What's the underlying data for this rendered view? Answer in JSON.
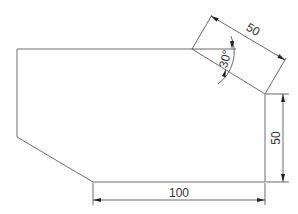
{
  "drawing": {
    "type": "technical-drawing",
    "shape": "chamfered-polygon",
    "dimensions": {
      "bottom_width": "100",
      "right_height": "50",
      "chamfer_length": "50",
      "chamfer_angle": "30°"
    }
  },
  "colors": {
    "outline": "#6e6e6e",
    "dimension": "#444444",
    "text": "#333333",
    "background": "#ffffff"
  }
}
